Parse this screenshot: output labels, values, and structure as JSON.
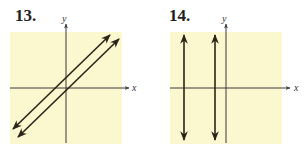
{
  "figures": [
    {
      "number_label": "13.",
      "x_axis_label": "x",
      "y_axis_label": "y",
      "description": "Two parallel lines with positive slope",
      "background_color": "#fbf7cf",
      "line_color": "#2b2418"
    },
    {
      "number_label": "14.",
      "x_axis_label": "x",
      "y_axis_label": "y",
      "description": "Two parallel vertical lines left of the y-axis",
      "background_color": "#fbf7cf",
      "line_color": "#2b2418"
    }
  ]
}
